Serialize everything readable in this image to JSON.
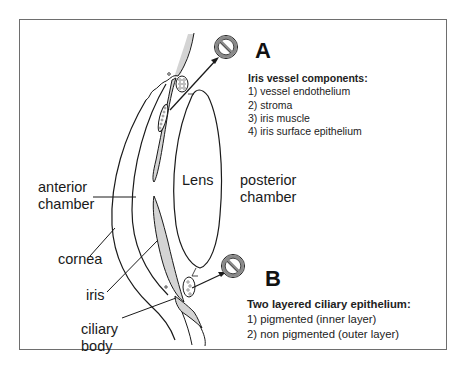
{
  "diagram": {
    "type": "anatomical-cross-section",
    "colors": {
      "line": "#1a1a1a",
      "frame": "#6e6e6e",
      "tissue_shading": "#d4d4d4",
      "prohibition_ring": "#8a8a8a"
    }
  },
  "labels": {
    "lens": "Lens",
    "posterior_chamber": [
      "posterior",
      "chamber"
    ],
    "anterior_chamber": [
      "anterior",
      "chamber"
    ],
    "cornea": "cornea",
    "iris": "iris",
    "ciliary_body": [
      "ciliary",
      "body"
    ]
  },
  "panel_a": {
    "marker": "A",
    "icon": "prohibition-icon",
    "title": "Iris vessel components:",
    "items": [
      "1) vessel endothelium",
      "2) stroma",
      "3) iris muscle",
      "4) iris surface epithelium"
    ]
  },
  "panel_b": {
    "marker": "B",
    "icon": "prohibition-icon",
    "title": "Two layered ciliary epithelium:",
    "items": [
      "1) pigmented (inner layer)",
      "2) non pigmented (outer layer)"
    ]
  }
}
